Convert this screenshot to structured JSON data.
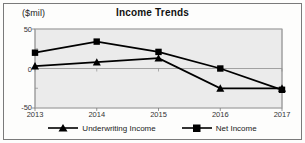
{
  "chart_data": {
    "type": "line",
    "title": "Income Trends",
    "xlabel": "",
    "ylabel": "($mil)",
    "unit_label": "($mil)",
    "categories": [
      "2013",
      "2014",
      "2015",
      "2016",
      "2017"
    ],
    "ylim": [
      -50,
      50
    ],
    "yticks": [
      "50",
      "0",
      "-50"
    ],
    "ytick_values": [
      50,
      0,
      -50
    ],
    "grid": true,
    "legend_position": "bottom",
    "series": [
      {
        "name": "Underwriting Income",
        "marker": "triangle",
        "color": "#000000",
        "values": [
          3,
          8,
          13,
          -25,
          -25
        ]
      },
      {
        "name": "Net Income",
        "marker": "square",
        "color": "#000000",
        "values": [
          20,
          34,
          21,
          0,
          -27
        ]
      }
    ]
  },
  "legend": {
    "entries": [
      {
        "label": "Underwriting Income",
        "marker": "triangle-marker"
      },
      {
        "label": "Net Income",
        "marker": "square-marker"
      }
    ]
  }
}
